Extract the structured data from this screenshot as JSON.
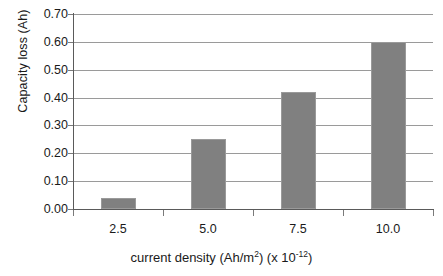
{
  "chart_data": {
    "type": "bar",
    "title": "",
    "categories": [
      "2.5",
      "5.0",
      "7.5",
      "10.0"
    ],
    "values": [
      0.04,
      0.25,
      0.42,
      0.6
    ],
    "series": [
      {
        "name": "Capacity loss",
        "values": [
          0.04,
          0.25,
          0.42,
          0.6
        ]
      }
    ],
    "xlabel": "current density (Ah/m2) (x 10-12)",
    "ylabel": "Capacity loss (Ah)",
    "ylim": [
      0.0,
      0.7
    ],
    "ytick_labels": [
      "0.70",
      "0.60",
      "0.50",
      "0.40",
      "0.30",
      "0.20",
      "0.10",
      "0.00"
    ],
    "ytick_values": [
      0.7,
      0.6,
      0.5,
      0.4,
      0.3,
      0.2,
      0.1,
      0.0
    ],
    "grid": "horizontal",
    "legend": "none",
    "bar_color": "#808080",
    "gridline_color": "#9a9a9a",
    "axis_color": "#5a5a5a",
    "background_color": "#ffffff"
  },
  "axes": {
    "y_title": "Capacity loss (Ah)",
    "x_title_main": "current density (Ah/m",
    "x_title_sup_unit": "2",
    "x_title_mid": ") (x 10",
    "x_title_sup_exp": "-12",
    "x_title_end": ")"
  }
}
